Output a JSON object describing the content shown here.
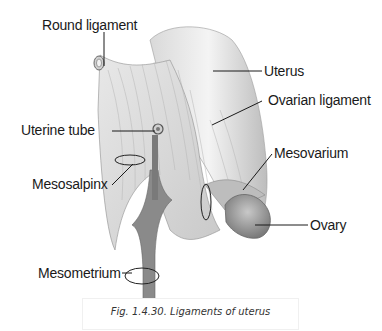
{
  "figure": {
    "caption": "Fig. 1.4.30. Ligaments of uterus",
    "labels": {
      "round_ligament": "Round ligament",
      "uterus": "Uterus",
      "ovarian_ligament": "Ovarian ligament",
      "uterine_tube": "Uterine tube",
      "mesovarium": "Mesovarium",
      "mesosalpinx": "Mesosalpinx",
      "ovary": "Ovary",
      "mesometrium": "Mesometrium"
    }
  }
}
